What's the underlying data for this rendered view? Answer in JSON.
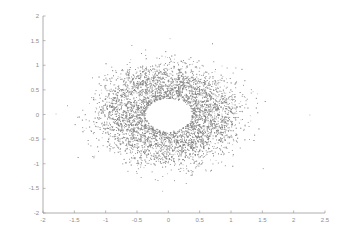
{
  "chart_data": {
    "type": "scatter",
    "title": "",
    "xlabel": "",
    "ylabel": "",
    "xlim": [
      -2,
      2.5
    ],
    "ylim": [
      -2,
      2
    ],
    "grid": false,
    "legend": null,
    "x_ticks": [
      -2,
      -1.5,
      -1,
      -0.5,
      0,
      0.5,
      1,
      1.5,
      2,
      2.5
    ],
    "x_tick_labels": [
      "-2",
      "-1.5",
      "-1",
      "-0.5",
      "0",
      "0.5",
      "1",
      "1.5",
      "2",
      "2.5"
    ],
    "y_ticks": [
      2,
      1.5,
      1,
      0.5,
      0,
      -0.5,
      -1,
      -1.5,
      -2
    ],
    "y_tick_labels": [
      "2",
      "1.5",
      "1",
      "0.5",
      "0",
      "-0.5",
      "-1",
      "-1.5",
      "-2"
    ],
    "series": [
      {
        "name": "points",
        "color": "#7d7d7d",
        "shape": "annulus",
        "center": [
          0,
          0
        ],
        "inner_radius_x": 0.35,
        "inner_radius_y": 0.34,
        "outer_radius_x": 1.1,
        "outer_radius_y": 1.0,
        "point_count": 9000,
        "outliers": [
          [
            2.25,
            0.0
          ],
          [
            -1.8,
            0.02
          ],
          [
            0.02,
            1.55
          ],
          [
            -0.1,
            -1.55
          ]
        ]
      }
    ]
  },
  "colors": {
    "background": "#ffffff",
    "axis": "#9a9a9a",
    "tick_label": "#8c8c8c",
    "points": "#7d7d7d"
  }
}
